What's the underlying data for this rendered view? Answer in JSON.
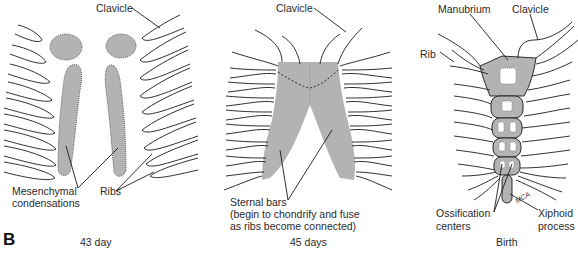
{
  "figure": {
    "panel_letter": "B",
    "colors": {
      "cartilage_fill": "#b3b3b3",
      "line": "#1a1a1a",
      "background": "#ffffff"
    },
    "stages": [
      {
        "caption": "43 day",
        "labels": {
          "clavicle": "Clavicle",
          "condensations_1": "Mesenchymal",
          "condensations_2": "condensations",
          "ribs": "Ribs"
        }
      },
      {
        "caption": "45 days",
        "labels": {
          "clavicle": "Clavicle",
          "sternal_1": "Sternal bars",
          "sternal_2": "(begin to chondrify and fuse",
          "sternal_3": "as ribs become connected)"
        }
      },
      {
        "caption": "Birth",
        "labels": {
          "manubrium": "Manubrium",
          "clavicle": "Clavicle",
          "rib": "Rib",
          "ossification_1": "Ossification",
          "ossification_2": "centers",
          "xiphoid_1": "Xiphoid",
          "xiphoid_2": "process"
        }
      }
    ]
  }
}
